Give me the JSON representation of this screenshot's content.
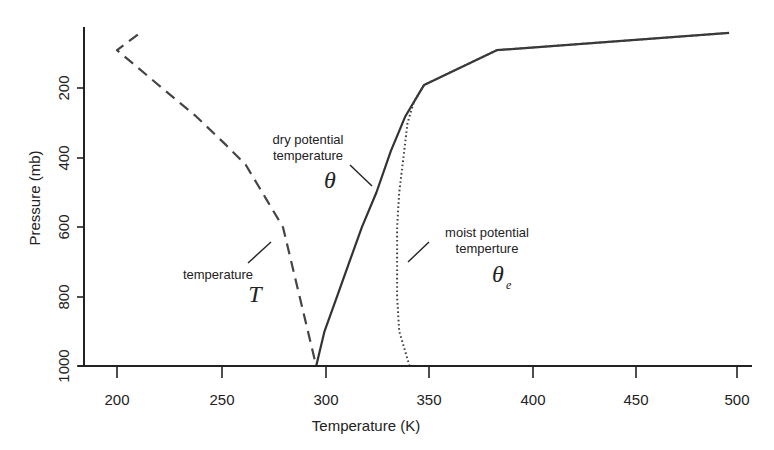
{
  "chart_data": {
    "type": "line",
    "title": "",
    "xlabel": "Temperature (K)",
    "ylabel": "Pressure (mb)",
    "xlim": [
      184,
      507
    ],
    "ylim": [
      1000,
      23
    ],
    "y_inverted": true,
    "grid": false,
    "legend": "none (inline annotations)",
    "x_ticks": [
      200,
      250,
      300,
      350,
      400,
      450,
      500
    ],
    "y_ticks": [
      200,
      400,
      600,
      800,
      1000
    ],
    "series": [
      {
        "name": "temperature T",
        "style": "dashed",
        "color": "#444444",
        "points": [
          [
            210,
            45
          ],
          [
            200,
            90
          ],
          [
            218,
            180
          ],
          [
            238,
            280
          ],
          [
            252,
            360
          ],
          [
            262,
            420
          ],
          [
            272,
            520
          ],
          [
            280,
            600
          ],
          [
            288,
            800
          ],
          [
            296,
            1000
          ]
        ]
      },
      {
        "name": "dry potential temperature θ",
        "style": "solid",
        "color": "#333333",
        "points": [
          [
            296,
            1000
          ],
          [
            300,
            900
          ],
          [
            306,
            800
          ],
          [
            312,
            700
          ],
          [
            318,
            600
          ],
          [
            325,
            500
          ],
          [
            332,
            380
          ],
          [
            339,
            280
          ],
          [
            348,
            190
          ],
          [
            383,
            90
          ],
          [
            495,
            40
          ]
        ]
      },
      {
        "name": "moist potential temperture θe",
        "style": "dotted",
        "color": "#444444",
        "points": [
          [
            341,
            1000
          ],
          [
            336,
            900
          ],
          [
            335,
            800
          ],
          [
            335,
            700
          ],
          [
            335,
            600
          ],
          [
            336,
            500
          ],
          [
            338,
            400
          ],
          [
            340,
            300
          ],
          [
            343,
            240
          ],
          [
            348,
            190
          ],
          [
            383,
            90
          ],
          [
            495,
            40
          ]
        ]
      }
    ],
    "annotations": [
      {
        "text": [
          "dry potential",
          "temperature"
        ],
        "symbol": "θ",
        "points_to": "θ curve near 325 K / 480 mb"
      },
      {
        "text": [
          "temperature"
        ],
        "symbol": "T",
        "points_to": "T curve near 276 K / 600 mb"
      },
      {
        "text": [
          "moist potential",
          "temperture"
        ],
        "symbol": "θ",
        "subscript": "e",
        "points_to": "θe curve near 337 K / 620 mb"
      }
    ]
  },
  "labels": {
    "xlabel": "Temperature (K)",
    "ylabel": "Pressure (mb)",
    "x_ticks": [
      "200",
      "250",
      "300",
      "350",
      "400",
      "450",
      "500"
    ],
    "y_ticks": [
      "200",
      "400",
      "600",
      "800",
      "1000"
    ],
    "dry_line1": "dry potential",
    "dry_line2": "temperature",
    "dry_symbol": "θ",
    "temp_line1": "temperature",
    "temp_symbol": "T",
    "moist_line1": "moist potential",
    "moist_line2": "temperture",
    "moist_symbol": "θ",
    "moist_sub": "e"
  }
}
